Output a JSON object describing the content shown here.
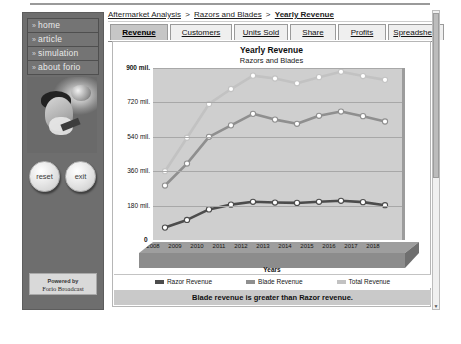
{
  "sidebar": {
    "items": [
      {
        "label": "home",
        "icon": "chevron-right-icon"
      },
      {
        "label": "article",
        "icon": "chevron-right-icon"
      },
      {
        "label": "simulation",
        "icon": "chevron-right-icon"
      },
      {
        "label": "about forio",
        "icon": "chevron-right-icon"
      }
    ],
    "buttons": [
      {
        "label": "reset",
        "name": "reset-button"
      },
      {
        "label": "exit",
        "name": "exit-button"
      }
    ],
    "powered_by": {
      "line1": "Powered by",
      "line2": "Forio Broadcast"
    }
  },
  "breadcrumb": {
    "items": [
      "Aftermarket Analysis",
      "Razors and Blades",
      "Yearly Revenue"
    ],
    "separator": ">"
  },
  "tabs": [
    {
      "label": "Revenue",
      "active": true
    },
    {
      "label": "Customers",
      "active": false
    },
    {
      "label": "Units Sold",
      "active": false
    },
    {
      "label": "Share",
      "active": false
    },
    {
      "label": "Profits",
      "active": false
    },
    {
      "label": "Spreadsheet",
      "active": false
    }
  ],
  "message_bar": {
    "text": "Blade revenue is greater than Razor revenue."
  },
  "colors": {
    "razor": "#4c4c4c",
    "blade": "#8f8f8f",
    "total": "#c2c2c2",
    "plot_background": "#cfcfcf",
    "marker_fill": "#ffffff",
    "active_tab": "#c6c6c6",
    "message_bar": "#c9c9c9"
  },
  "chart_data": {
    "type": "line",
    "title": "Yearly Revenue",
    "subtitle": "Razors and Blades",
    "xlabel": "Years",
    "ylabel": "",
    "grid": true,
    "legend_position": "bottom",
    "ylim": [
      0,
      900
    ],
    "ytick_labels": [
      "900 mil.",
      "720 mil.",
      "540 mil.",
      "360 mil.",
      "180 mil.",
      "0"
    ],
    "ytick_values": [
      900,
      720,
      540,
      360,
      180,
      0
    ],
    "categories": [
      "2008",
      "2009",
      "2010",
      "2011",
      "2012",
      "2013",
      "2014",
      "2015",
      "2016",
      "2017",
      "2018"
    ],
    "series": [
      {
        "name": "Razor Revenue",
        "color": "#4c4c4c",
        "values": [
          65,
          105,
          160,
          185,
          200,
          196,
          194,
          200,
          205,
          198,
          182
        ]
      },
      {
        "name": "Blade Revenue",
        "color": "#8f8f8f",
        "values": [
          285,
          400,
          540,
          600,
          660,
          630,
          608,
          650,
          672,
          648,
          620
        ]
      },
      {
        "name": "Total Revenue",
        "color": "#c2c2c2",
        "values": [
          360,
          535,
          712,
          790,
          860,
          845,
          820,
          852,
          880,
          858,
          838
        ]
      }
    ]
  },
  "scrollbar": {
    "up_arrow": "▲",
    "down_arrow": "▼"
  }
}
